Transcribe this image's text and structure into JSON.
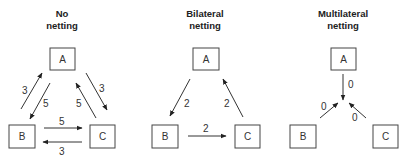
{
  "panels": [
    {
      "title_line1": "No",
      "title_line2": "netting",
      "nodes": {
        "A": "A",
        "B": "B",
        "C": "C"
      },
      "edges": [
        {
          "from": "B",
          "to": "A",
          "value": "3"
        },
        {
          "from": "A",
          "to": "B",
          "value": "5"
        },
        {
          "from": "A",
          "to": "C",
          "value": "3"
        },
        {
          "from": "C",
          "to": "A",
          "value": "5"
        },
        {
          "from": "B",
          "to": "C",
          "value": "5"
        },
        {
          "from": "C",
          "to": "B",
          "value": "3"
        }
      ]
    },
    {
      "title_line1": "Bilateral",
      "title_line2": "netting",
      "nodes": {
        "A": "A",
        "B": "B",
        "C": "C"
      },
      "edges": [
        {
          "from": "A",
          "to": "B",
          "value": "2"
        },
        {
          "from": "C",
          "to": "A",
          "value": "2"
        },
        {
          "from": "B",
          "to": "C",
          "value": "2"
        }
      ]
    },
    {
      "title_line1": "Multilateral",
      "title_line2": "netting",
      "nodes": {
        "A": "A",
        "B": "B",
        "C": "C"
      },
      "edges": [
        {
          "from": "A",
          "to": "center",
          "value": "0"
        },
        {
          "from": "B",
          "to": "center",
          "value": "0"
        },
        {
          "from": "C",
          "to": "center",
          "value": "0"
        }
      ]
    }
  ]
}
